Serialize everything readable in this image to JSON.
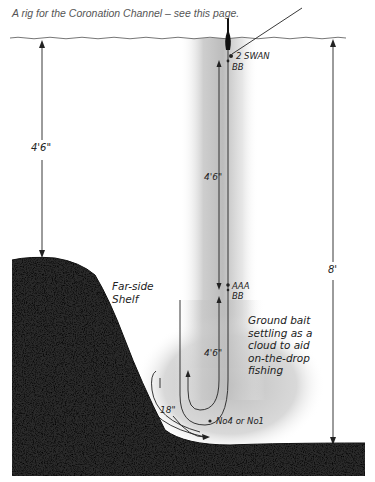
{
  "caption": "A rig for the Coronation Channel – see this page.",
  "labels": {
    "left_depth": "4'6\"",
    "total_depth": "8'",
    "upper_line_length": "4'6\"",
    "lower_line_length": "4'6\"",
    "swing": "18\"",
    "shelf": [
      "Far-side",
      "Shelf"
    ],
    "groundbait": [
      "Ground bait",
      "settling as a",
      "cloud to aid",
      "on-the-drop",
      "fishing"
    ]
  },
  "shot": {
    "top_1": "2 SWAN",
    "top_2": "BB",
    "mid_1": "AAA",
    "mid_2": "BB",
    "hook": "No4 or No1"
  },
  "colors": {
    "ink": "#222222",
    "cloud": "#bdbdbd",
    "water_line": "#666666"
  }
}
